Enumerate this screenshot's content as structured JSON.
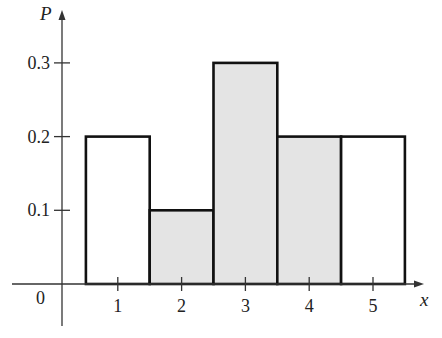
{
  "chart_data": {
    "type": "bar",
    "title": "",
    "xlabel": "x",
    "ylabel": "P",
    "categories": [
      "1",
      "2",
      "3",
      "4",
      "5"
    ],
    "x": [
      1,
      2,
      3,
      4,
      5
    ],
    "values": [
      0.2,
      0.1,
      0.3,
      0.2,
      0.2
    ],
    "shaded": [
      false,
      true,
      true,
      true,
      false
    ],
    "xlim": [
      0,
      5.5
    ],
    "ylim": [
      0,
      0.3
    ],
    "xticks": [
      "1",
      "2",
      "3",
      "4",
      "5"
    ],
    "yticks": [
      "0.1",
      "0.2",
      "0.3"
    ],
    "origin_label": "0",
    "grid": false,
    "legend": "none",
    "colors": {
      "shaded_fill": "#e4e4e4",
      "unshaded_fill": "#ffffff",
      "stroke": "#111111",
      "axis": "#333333"
    }
  }
}
